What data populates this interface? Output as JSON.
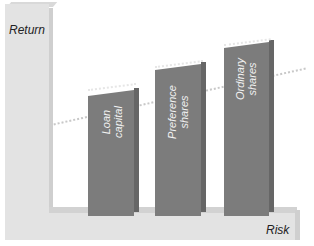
{
  "diagram": {
    "axes": {
      "y_label": "Return",
      "x_label": "Risk"
    },
    "bars": [
      {
        "label_line1": "Loan",
        "label_line2": "capital",
        "order": 1
      },
      {
        "label_line1": "Preference",
        "label_line2": "shares",
        "order": 2
      },
      {
        "label_line1": "Ordinary",
        "label_line2": "shares",
        "order": 3
      }
    ],
    "trend_line": "dotted line rising from left to right indicating higher return with higher risk",
    "colors": {
      "axis_block": "#e3e3e3",
      "bar_fill": "#7c7c7c",
      "bar_label_text": "#f2f2f2",
      "trend_line": "#c8c8c8"
    }
  }
}
